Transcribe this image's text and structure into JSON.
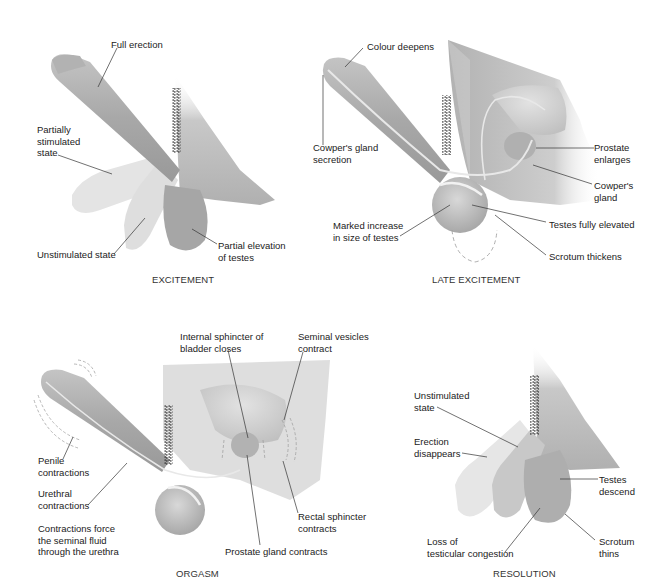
{
  "diagram": {
    "panels": [
      {
        "id": "excitement",
        "title": "EXCITEMENT",
        "labels": {
          "full_erection": "Full erection",
          "partially_stimulated": "Partially\nstimulated\nstate",
          "unstimulated": "Unstimulated state",
          "partial_elevation": "Partial elevation\nof testes"
        }
      },
      {
        "id": "late-excitement",
        "title": "LATE EXCITEMENT",
        "labels": {
          "colour_deepens": "Colour deepens",
          "cowpers_secretion": "Cowper's gland\nsecretion",
          "prostate_enlarges": "Prostate\nenlarges",
          "cowpers_gland": "Cowper's\ngland",
          "marked_increase": "Marked increase\nin size of testes",
          "testes_elevated": "Testes fully elevated",
          "scrotum_thickens": "Scrotum thickens"
        }
      },
      {
        "id": "orgasm",
        "title": "ORGASM",
        "labels": {
          "internal_sphincter": "Internal sphincter of\nbladder closes",
          "seminal_vesicles": "Seminal vesicles\ncontract",
          "penile_contractions": "Penile\ncontractions",
          "urethral_contractions": "Urethral\ncontractions",
          "contractions_force": "Contractions force\nthe seminal fluid\nthrough the urethra",
          "rectal_sphincter": "Rectal sphincter\ncontracts",
          "prostate_contracts": "Prostate gland contracts"
        }
      },
      {
        "id": "resolution",
        "title": "RESOLUTION",
        "labels": {
          "unstimulated": "Unstimulated\nstate",
          "erection_disappears": "Erection\ndisappears",
          "testes_descend": "Testes\ndescend",
          "loss_congestion": "Loss of\ntesticular congestion",
          "scrotum_thins": "Scrotum\nthins"
        }
      }
    ],
    "colors": {
      "tissue_dark": "#9a9a9a",
      "tissue_mid": "#b5b5b5",
      "tissue_light": "#dcdcdc",
      "tissue_faint": "#ececec",
      "leader_line": "#333333",
      "text": "#222222"
    }
  }
}
